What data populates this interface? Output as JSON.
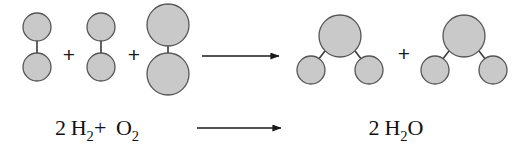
{
  "figure": {
    "name": "water-formation-reaction",
    "background_color": "#ffffff",
    "width": 530,
    "height": 155
  },
  "style": {
    "atom_fill": "#c9c9c9",
    "atom_stroke": "#555555",
    "bond_color": "#3a3a3a",
    "arrow_color": "#1a1a1a",
    "text_color": "#111111"
  },
  "molecular_row": {
    "reactants": [
      {
        "name": "hydrogen-molecule-1",
        "formula": "H2",
        "atoms": [
          {
            "element": "H",
            "cx": 37,
            "cy": 27,
            "r": 14
          },
          {
            "element": "H",
            "cx": 37,
            "cy": 67,
            "r": 14
          }
        ],
        "bonds": [
          {
            "x1": 37,
            "y1": 41,
            "x2": 37,
            "y2": 53
          }
        ]
      },
      {
        "name": "hydrogen-molecule-2",
        "formula": "H2",
        "atoms": [
          {
            "element": "H",
            "cx": 101,
            "cy": 27,
            "r": 14
          },
          {
            "element": "H",
            "cx": 101,
            "cy": 67,
            "r": 14
          }
        ],
        "bonds": [
          {
            "x1": 101,
            "y1": 41,
            "x2": 101,
            "y2": 53
          }
        ]
      },
      {
        "name": "oxygen-molecule",
        "formula": "O2",
        "atoms": [
          {
            "element": "O",
            "cx": 168,
            "cy": 25,
            "r": 21
          },
          {
            "element": "O",
            "cx": 168,
            "cy": 74,
            "r": 21
          }
        ],
        "bonds": [
          {
            "x1": 168,
            "y1": 46,
            "x2": 168,
            "y2": 53
          }
        ]
      }
    ],
    "products": [
      {
        "name": "water-molecule-1",
        "formula": "H2O",
        "atoms": [
          {
            "element": "O",
            "cx": 340,
            "cy": 36,
            "r": 21
          },
          {
            "element": "H",
            "cx": 311,
            "cy": 70,
            "r": 14
          },
          {
            "element": "H",
            "cx": 369,
            "cy": 70,
            "r": 14
          }
        ],
        "bonds": [
          {
            "x1": 325,
            "y1": 51,
            "x2": 318,
            "y2": 60
          },
          {
            "x1": 355,
            "y1": 51,
            "x2": 362,
            "y2": 60
          }
        ]
      },
      {
        "name": "water-molecule-2",
        "formula": "H2O",
        "atoms": [
          {
            "element": "O",
            "cx": 464,
            "cy": 36,
            "r": 21
          },
          {
            "element": "H",
            "cx": 435,
            "cy": 70,
            "r": 14
          },
          {
            "element": "H",
            "cx": 493,
            "cy": 70,
            "r": 14
          }
        ],
        "bonds": [
          {
            "x1": 449,
            "y1": 51,
            "x2": 442,
            "y2": 60
          },
          {
            "x1": 479,
            "y1": 51,
            "x2": 486,
            "y2": 60
          }
        ]
      }
    ],
    "plus_signs": [
      {
        "name": "plus-reactants-1",
        "symbol": "+",
        "x": 69,
        "y": 54
      },
      {
        "name": "plus-reactants-2",
        "symbol": "+",
        "x": 134,
        "y": 54
      },
      {
        "name": "plus-products-1",
        "symbol": "+",
        "x": 404,
        "y": 53
      }
    ],
    "arrow": {
      "name": "reaction-arrow-molecular",
      "x1": 202,
      "y1": 56,
      "x2": 279,
      "y2": 56
    }
  },
  "equation_row": {
    "reactant_label": {
      "name": "reactant-formula",
      "coefficient_h2": "2",
      "h_symbol": "H",
      "h_subscript": "2",
      "plus": "+",
      "o_symbol": "O",
      "o_subscript": "2",
      "x": 97,
      "y": 128
    },
    "product_label": {
      "name": "product-formula",
      "coefficient_h2o": "2",
      "h_symbol": "H",
      "h_subscript": "2",
      "o_symbol": "O",
      "x": 396,
      "y": 128
    },
    "arrow": {
      "name": "reaction-arrow-equation",
      "x1": 197,
      "y1": 128,
      "x2": 281,
      "y2": 128
    }
  }
}
